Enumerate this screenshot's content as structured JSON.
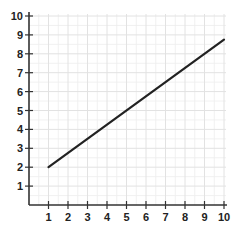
{
  "chart_data": {
    "type": "line",
    "title": "",
    "xlabel": "",
    "ylabel": "",
    "xlim": [
      0,
      10
    ],
    "ylim": [
      0,
      10
    ],
    "grid": true,
    "legend": null,
    "x_ticks": [
      1,
      2,
      3,
      4,
      5,
      6,
      7,
      8,
      9,
      10
    ],
    "y_ticks": [
      1,
      2,
      3,
      4,
      5,
      6,
      7,
      8,
      9,
      10
    ],
    "series": [
      {
        "name": "line",
        "color": "#222222",
        "x": [
          1,
          10
        ],
        "y": [
          2,
          8.75
        ]
      }
    ],
    "annotations": []
  },
  "colors": {
    "axis": "#333333",
    "grid_major": "#e2e2e2",
    "grid_minor": "#eeeeee",
    "line": "#222222",
    "text": "#222222"
  },
  "layout": {
    "origin_px": [
      29,
      205
    ],
    "x_unit_px": 19.5,
    "y_unit_px": 18.9
  }
}
